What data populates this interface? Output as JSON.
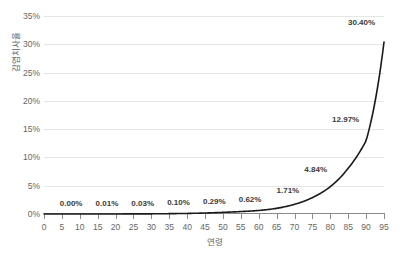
{
  "chart_data": {
    "type": "line",
    "title": "",
    "subtitle": "",
    "xlabel": "연령",
    "ylabel": "감염치사율",
    "xlim": [
      0,
      95
    ],
    "ylim": [
      0,
      35
    ],
    "grid": true,
    "legend": null,
    "line_color": "#1a1a1a",
    "grid_color": "#e6e6e6",
    "axis_color": "#8c8c8c",
    "x_ticks": [
      "0",
      "5",
      "10",
      "15",
      "20",
      "25",
      "30",
      "35",
      "40",
      "45",
      "50",
      "55",
      "60",
      "65",
      "70",
      "75",
      "80",
      "85",
      "90",
      "95"
    ],
    "y_ticks": [
      "0%",
      "5%",
      "10%",
      "15%",
      "20%",
      "25%",
      "30%",
      "35%"
    ],
    "y_tick_values": [
      0,
      5,
      10,
      15,
      20,
      25,
      30,
      35
    ],
    "x": [
      0,
      5,
      10,
      15,
      20,
      25,
      30,
      35,
      40,
      45,
      50,
      55,
      60,
      65,
      70,
      75,
      80,
      85,
      90,
      95
    ],
    "values": [
      0.0,
      0.0,
      0.001,
      0.003,
      0.01,
      0.02,
      0.03,
      0.06,
      0.1,
      0.18,
      0.29,
      0.43,
      0.62,
      1.0,
      1.71,
      2.9,
      4.84,
      8.1,
      12.97,
      30.4
    ],
    "annotations": [
      {
        "label": "0.00%",
        "x": 10,
        "y": 0.001
      },
      {
        "label": "0.01%",
        "x": 20,
        "y": 0.01
      },
      {
        "label": "0.03%",
        "x": 30,
        "y": 0.03
      },
      {
        "label": "0.10%",
        "x": 40,
        "y": 0.1
      },
      {
        "label": "0.29%",
        "x": 50,
        "y": 0.29
      },
      {
        "label": "0.62%",
        "x": 60,
        "y": 0.62
      },
      {
        "label": "1.71%",
        "x": 70,
        "y": 1.71
      },
      {
        "label": "4.84%",
        "x": 80,
        "y": 4.84
      },
      {
        "label": "12.97%",
        "x": 90,
        "y": 12.97
      },
      {
        "label": "30.40%",
        "x": 95,
        "y": 30.4
      }
    ]
  }
}
